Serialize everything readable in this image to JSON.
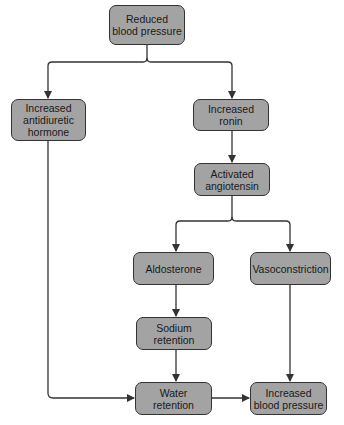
{
  "diagram": {
    "type": "flowchart",
    "colors": {
      "node_fill": "#a3a3a3",
      "node_border": "#333333",
      "edge": "#333333"
    },
    "nodes": {
      "reduced_bp": {
        "label": "Reduced\nblood pressure"
      },
      "adh": {
        "label": "Increased\nantidiuretic\nhormone"
      },
      "renin": {
        "label": "Increased\nronin"
      },
      "angiotensin": {
        "label": "Activated\nangiotensin"
      },
      "aldosterone": {
        "label": "Aldosterone"
      },
      "vasoconstriction": {
        "label": "Vasoconstriction"
      },
      "sodium": {
        "label": "Sodium\nretention"
      },
      "water": {
        "label": "Water\nretention"
      },
      "increased_bp": {
        "label": "Increased\nblood pressure"
      }
    },
    "edges": [
      {
        "from": "reduced_bp",
        "to": "adh"
      },
      {
        "from": "reduced_bp",
        "to": "renin"
      },
      {
        "from": "renin",
        "to": "angiotensin"
      },
      {
        "from": "angiotensin",
        "to": "aldosterone"
      },
      {
        "from": "angiotensin",
        "to": "vasoconstriction"
      },
      {
        "from": "aldosterone",
        "to": "sodium"
      },
      {
        "from": "sodium",
        "to": "water"
      },
      {
        "from": "adh",
        "to": "water"
      },
      {
        "from": "water",
        "to": "increased_bp"
      },
      {
        "from": "vasoconstriction",
        "to": "increased_bp"
      }
    ]
  }
}
